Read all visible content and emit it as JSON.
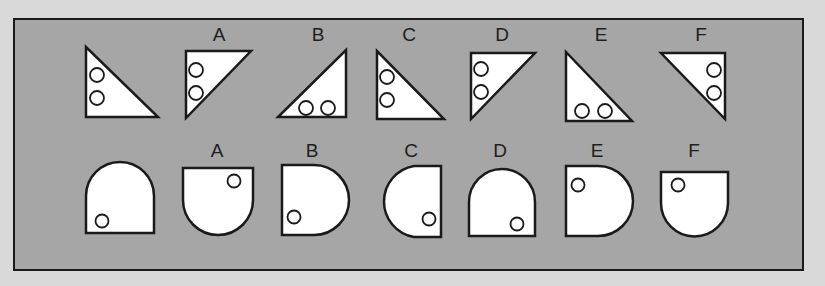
{
  "puzzle": {
    "top_row": {
      "reference": {
        "shape": "right-triangle",
        "circles": 2
      },
      "options": [
        {
          "label": "A"
        },
        {
          "label": "B"
        },
        {
          "label": "C"
        },
        {
          "label": "D"
        },
        {
          "label": "E"
        },
        {
          "label": "F"
        }
      ]
    },
    "bottom_row": {
      "reference": {
        "shape": "rounded-arch",
        "circles": 1
      },
      "options": [
        {
          "label": "A"
        },
        {
          "label": "B"
        },
        {
          "label": "C"
        },
        {
          "label": "D"
        },
        {
          "label": "E"
        },
        {
          "label": "F"
        }
      ]
    },
    "colors": {
      "panel": "#a6a6a6",
      "background": "#d9d9d9",
      "stroke": "#1a1a1a",
      "fill": "#ffffff"
    }
  }
}
